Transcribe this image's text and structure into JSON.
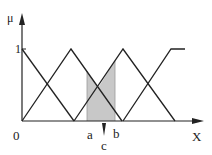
{
  "diagram": {
    "type": "fuzzy-membership-functions",
    "y_axis_label": "μ",
    "x_axis_label": "X",
    "y_tick_one": "1",
    "origin_label": "0",
    "interval_start_label": "a",
    "interval_end_label": "b",
    "centroid_label": "c",
    "shade_color": "#c8c8c8",
    "line_color": "#222222",
    "membership_functions": [
      {
        "name": "mf1",
        "shape": "descending-ramp",
        "points": [
          [
            0,
            1
          ],
          [
            1,
            0
          ]
        ]
      },
      {
        "name": "mf2",
        "shape": "triangle",
        "points": [
          [
            0,
            0
          ],
          [
            1,
            1
          ],
          [
            2,
            0
          ]
        ]
      },
      {
        "name": "mf3",
        "shape": "triangle",
        "points": [
          [
            1,
            0
          ],
          [
            2,
            1
          ],
          [
            3,
            0
          ]
        ]
      },
      {
        "name": "mf4",
        "shape": "trapezoid-shoulder",
        "points": [
          [
            2,
            0
          ],
          [
            3,
            1
          ],
          [
            3.3,
            1
          ]
        ]
      }
    ]
  }
}
